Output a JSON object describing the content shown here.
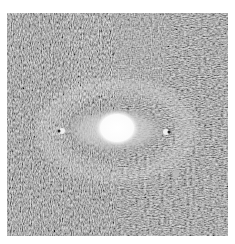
{
  "image": {
    "description": "Grayscale flow-field texture (line integral convolution style) with bright elliptical core",
    "panel": {
      "x": 7,
      "y": 13,
      "width": 221,
      "height": 223
    },
    "colors": {
      "background": "#ffffff",
      "texture_dark": "#3a3a3a",
      "texture_mid": "#6a6a6a",
      "texture_light": "#c8c8c8",
      "core_glow": "#dcdcdc",
      "core_center": "#ffffff"
    },
    "features": [
      {
        "name": "bright-core",
        "cx": 117,
        "cy": 128,
        "rx": 20,
        "ry": 17
      },
      {
        "name": "halo-ellipse",
        "cx": 115,
        "cy": 130,
        "rx": 52,
        "ry": 24
      },
      {
        "name": "left-pole",
        "cx": 62,
        "cy": 131
      },
      {
        "name": "right-pole",
        "cx": 166,
        "cy": 132
      },
      {
        "name": "small-spot",
        "cx": 176,
        "cy": 174
      }
    ]
  }
}
